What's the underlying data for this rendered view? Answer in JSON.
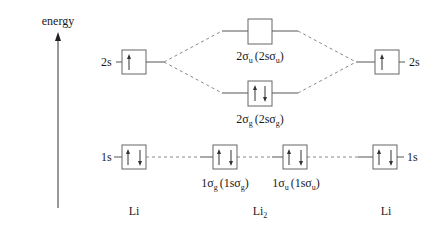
{
  "diagram": {
    "axis": {
      "label": "energy",
      "direction": "up"
    },
    "columns": [
      {
        "id": "li-left",
        "label": "Li"
      },
      {
        "id": "li2",
        "label": "Li",
        "label_subscript": "2"
      },
      {
        "id": "li-right",
        "label": "Li"
      }
    ],
    "atomic_orbitals": {
      "left_2s": {
        "label": "2s",
        "electrons": "↑",
        "occupancy": 1
      },
      "left_1s": {
        "label": "1s",
        "electrons": "↑↓",
        "occupancy": 2
      },
      "right_2s": {
        "label": "2s",
        "electrons": "↑",
        "occupancy": 1
      },
      "right_1s": {
        "label": "1s",
        "electrons": "↑↓",
        "occupancy": 2
      }
    },
    "molecular_orbitals": {
      "sigma_u_2": {
        "label_main": "2σ",
        "label_sub": "u",
        "label_paren": "(2sσ",
        "label_paren_sub": "u",
        "label_close": ")",
        "occupancy": 0,
        "type": "antibonding"
      },
      "sigma_g_2": {
        "label_main": "2σ",
        "label_sub": "g",
        "label_paren": "(2sσ",
        "label_paren_sub": "g",
        "label_close": ")",
        "occupancy": 2,
        "type": "bonding"
      },
      "sigma_g_1": {
        "label_main": "1σ",
        "label_sub": "g",
        "label_paren": "(1sσ",
        "label_paren_sub": "g",
        "label_close": ")",
        "occupancy": 2,
        "type": "bonding"
      },
      "sigma_u_1": {
        "label_main": "1σ",
        "label_sub": "u",
        "label_paren": "(1sσ",
        "label_paren_sub": "u",
        "label_close": ")",
        "occupancy": 2,
        "type": "antibonding"
      }
    },
    "colors": {
      "line": "#555555",
      "box": "#666666",
      "dash": "#888888",
      "text": "#1a1a1a"
    }
  }
}
